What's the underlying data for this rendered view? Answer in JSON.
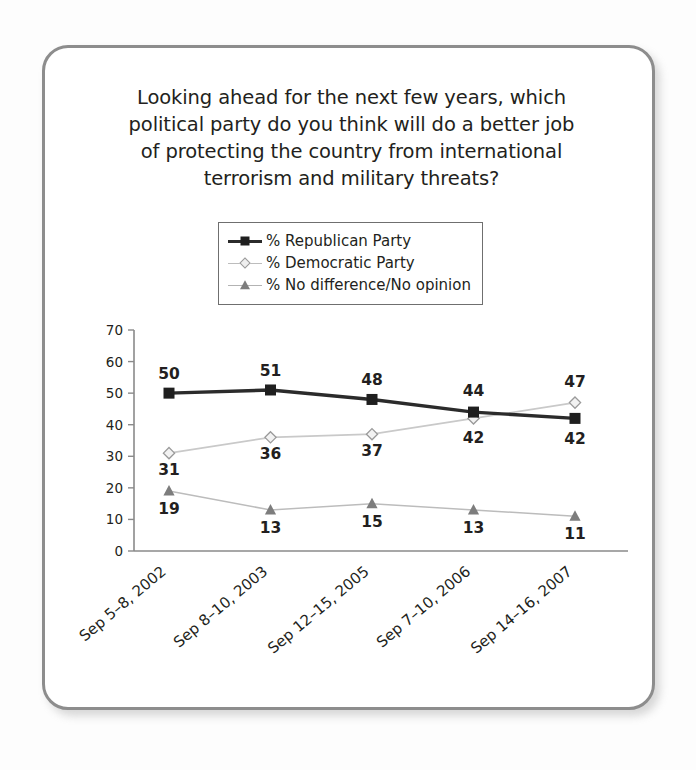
{
  "chart_data": {
    "type": "line",
    "title": "Looking ahead for the next few years, which\npolitical party do you think will do a better job\nof protecting the country from international\nterrorism and military threats?",
    "xlabel": "",
    "ylabel": "",
    "ylim": [
      0,
      70
    ],
    "yticks": [
      0,
      10,
      20,
      30,
      40,
      50,
      60,
      70
    ],
    "grid": false,
    "legend_position": "top-center",
    "categories": [
      "Sep 5–8, 2002",
      "Sep 8–10, 2003",
      "Sep 12–15, 2005",
      "Sep 7–10, 2006",
      "Sep 14–16, 2007"
    ],
    "series": [
      {
        "name": "% Republican Party",
        "marker": "square",
        "color": "#1f1f1f",
        "values": [
          50,
          51,
          48,
          44,
          42
        ]
      },
      {
        "name": "% Democratic Party",
        "marker": "diamond",
        "color": "#bdbdbd",
        "values": [
          31,
          36,
          37,
          42,
          47
        ]
      },
      {
        "name": "% No difference/No opinion",
        "marker": "triangle",
        "color": "#7d7d7d",
        "values": [
          19,
          13,
          15,
          13,
          11
        ]
      }
    ]
  },
  "legend": {
    "items": [
      {
        "label": "% Republican Party"
      },
      {
        "label": "% Democratic Party"
      },
      {
        "label": "% No difference/No opinion"
      }
    ]
  },
  "ytick_labels": [
    "70",
    "60",
    "50",
    "40",
    "30",
    "20",
    "10",
    "0"
  ],
  "data_labels": {
    "republican": [
      "50",
      "51",
      "48",
      "44",
      "42"
    ],
    "democratic": [
      "31",
      "36",
      "37",
      "42",
      "47"
    ],
    "nodifference": [
      "19",
      "13",
      "15",
      "13",
      "11"
    ]
  },
  "colors": {
    "republican": "#1f1f1f",
    "democratic": "#bdbdbd",
    "nodifference": "#7d7d7d",
    "axis": "#8a8a8a",
    "text": "#231f20",
    "card_border": "#8d8d8d"
  }
}
